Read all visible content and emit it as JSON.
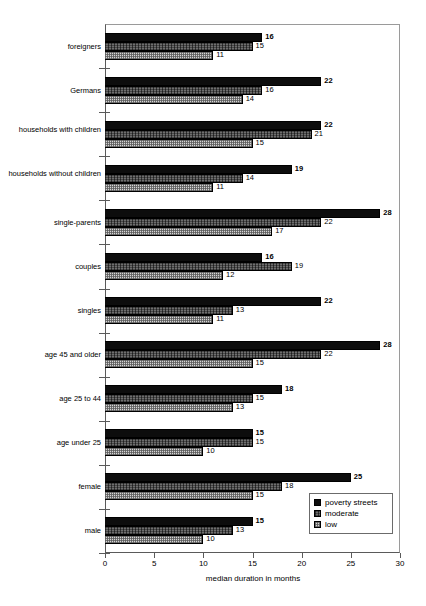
{
  "chart_data": {
    "type": "bar",
    "orientation": "horizontal",
    "title": "",
    "subtitle": "",
    "xlabel": "median duration in months",
    "ylabel": "",
    "xlim": [
      0,
      30
    ],
    "xticks": [
      0,
      5,
      10,
      15,
      20,
      25,
      30
    ],
    "xtick_labels": [
      "0",
      "5",
      "10",
      "15",
      "20",
      "25",
      "30"
    ],
    "grid": false,
    "legend_position": "bottom-right",
    "categories": [
      "foreigners",
      "Germans",
      "households with children",
      "households without children",
      "single-parents",
      "couples",
      "singles",
      "age 45 and older",
      "age 25 to 44",
      "age under 25",
      "female",
      "male"
    ],
    "series": [
      {
        "name": "poverty streets",
        "fill": "solid-black",
        "color": "#0d0d0d",
        "values": [
          16,
          22,
          22,
          19,
          28,
          16,
          22,
          28,
          18,
          15,
          25,
          15
        ]
      },
      {
        "name": "moderate",
        "fill": "dark-gray-hatch",
        "color": "#6e6e6e",
        "values": [
          15,
          16,
          21,
          14,
          22,
          19,
          13,
          22,
          15,
          15,
          18,
          13
        ]
      },
      {
        "name": "low",
        "fill": "light-checker",
        "color": "#d4d4d4",
        "values": [
          11,
          14,
          15,
          11,
          17,
          12,
          11,
          15,
          13,
          10,
          15,
          10
        ]
      }
    ],
    "data_labels": [
      {
        "category": "foreigners",
        "poverty streets": 16,
        "moderate": 15,
        "low": 11
      },
      {
        "category": "Germans",
        "poverty streets": 22,
        "moderate": 16,
        "low": 14
      },
      {
        "category": "households with children",
        "poverty streets": 22,
        "moderate": 21,
        "low": 15
      },
      {
        "category": "households without children",
        "poverty streets": 19,
        "moderate": 14,
        "low": 11
      },
      {
        "category": "single-parents",
        "poverty streets": 28,
        "moderate": 22,
        "low": 17
      },
      {
        "category": "couples",
        "poverty streets": 16,
        "moderate": 19,
        "low": 12
      },
      {
        "category": "singles",
        "poverty streets": 22,
        "moderate": 13,
        "low": 11
      },
      {
        "category": "age 45 and older",
        "poverty streets": 28,
        "moderate": 22,
        "low": 15
      },
      {
        "category": "age 25 to 44",
        "poverty streets": 18,
        "moderate": 15,
        "low": 13
      },
      {
        "category": "age under 25",
        "poverty streets": 15,
        "moderate": 15,
        "low": 10
      },
      {
        "category": "female",
        "poverty streets": 25,
        "moderate": 18,
        "low": 15
      },
      {
        "category": "male",
        "poverty streets": 15,
        "moderate": 13,
        "low": 10
      }
    ]
  },
  "legend": {
    "items": [
      {
        "label": "poverty streets"
      },
      {
        "label": "moderate"
      },
      {
        "label": "low"
      }
    ]
  },
  "axis": {
    "x_title": "median duration in months"
  }
}
